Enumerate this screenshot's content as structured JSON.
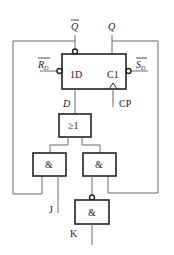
{
  "diagram": {
    "type": "logic-circuit",
    "flip_flop": {
      "data_input_label": "1D",
      "clock_input_label": "C1",
      "outputs": {
        "q": "Q",
        "q_bar": "Q"
      },
      "async_inputs": {
        "reset": "R",
        "reset_sub": "D",
        "set": "S",
        "set_sub": "D"
      }
    },
    "or_gate": {
      "label": "≥1"
    },
    "and_gates": [
      {
        "id": "and-left",
        "label": "&"
      },
      {
        "id": "and-right",
        "label": "&"
      },
      {
        "id": "and-bottom",
        "label": "&",
        "inverted_input": true
      }
    ],
    "signals": {
      "d": "D",
      "cp": "CP",
      "j": "J",
      "k": "K"
    }
  },
  "colors": {
    "wire": "#6b6b6b",
    "outline": "#222222",
    "background": "#ffffff"
  }
}
